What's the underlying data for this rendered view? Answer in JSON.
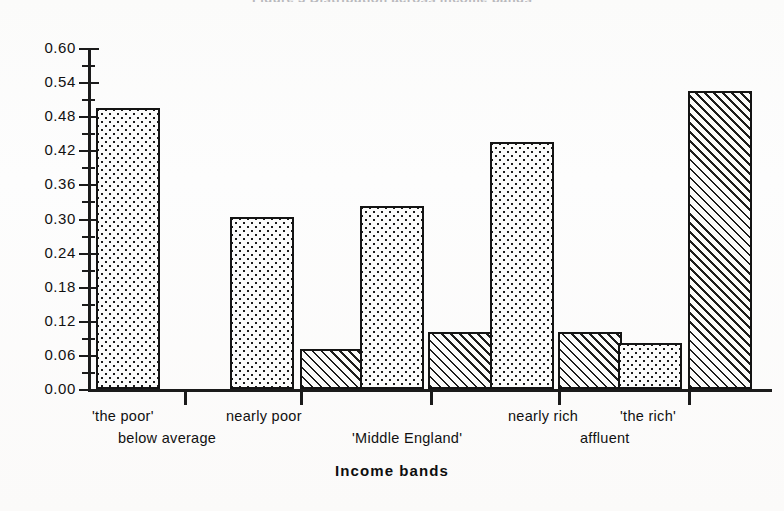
{
  "title_clipped": "Figure 3  Distribution across income bands",
  "axis": {
    "x_title": "Income bands",
    "y_ticks": [
      "0.60",
      "0.54",
      "0.48",
      "0.42",
      "0.36",
      "0.30",
      "0.24",
      "0.18",
      "0.12",
      "0.06",
      "0.00"
    ]
  },
  "category_labels": [
    {
      "text": "'the poor'",
      "x": 92,
      "y": 408
    },
    {
      "text": "below average",
      "x": 118,
      "y": 430
    },
    {
      "text": "nearly  poor",
      "x": 226,
      "y": 408
    },
    {
      "text": "'Middle England'",
      "x": 352,
      "y": 430
    },
    {
      "text": "nearly  rich",
      "x": 508,
      "y": 408
    },
    {
      "text": "affluent",
      "x": 580,
      "y": 430
    },
    {
      "text": "'the rich'",
      "x": 620,
      "y": 408
    }
  ],
  "chart_data": {
    "type": "bar",
    "title": "Figure 3  Distribution across income bands",
    "xlabel": "Income bands",
    "ylabel": "",
    "ylim": [
      0.0,
      0.6
    ],
    "ytick_interval": 0.06,
    "grid": false,
    "legend": "none",
    "categories": [
      "'the poor' / below average",
      "nearly poor",
      "'Middle England'",
      "nearly rich",
      "'the rich' / affluent"
    ],
    "series": [
      {
        "name": "dotted",
        "pattern": "stipple",
        "values": [
          0.49,
          0.3,
          0.32,
          0.43,
          0.08
        ]
      },
      {
        "name": "hatched",
        "pattern": "diagonal-hatch",
        "values": [
          0.0,
          0.07,
          0.1,
          0.1,
          0.52
        ]
      }
    ]
  },
  "geometry": {
    "baseline_y": 389,
    "top_y": 48,
    "px_per_unit": 573.3,
    "bar_width": 64,
    "groups": [
      {
        "dotted_x": 96,
        "hatched_x": 170
      },
      {
        "dotted_x": 230,
        "hatched_x": 300
      },
      {
        "dotted_x": 360,
        "hatched_x": 428
      },
      {
        "dotted_x": 490,
        "hatched_x": 558
      },
      {
        "dotted_x": 618,
        "hatched_x": 688
      }
    ],
    "x_ticks": [
      184,
      300,
      430,
      558,
      688
    ]
  },
  "colors": {
    "ink": "#1b1b1b",
    "paper": "#fdfdfc",
    "ghost_title": "#b9b9bd"
  }
}
